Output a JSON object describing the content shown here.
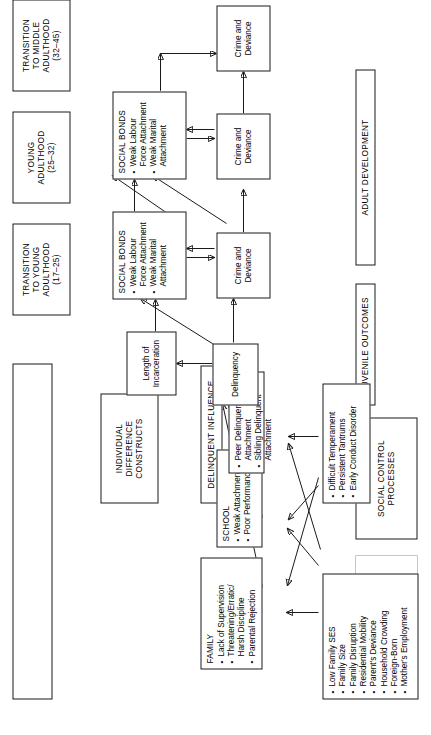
{
  "phase_headers": [
    {
      "id": "structural",
      "lines": [
        "STRUCTURAL",
        "BACKGROUND",
        "FACTORS"
      ]
    },
    {
      "id": "social-control",
      "lines": [
        "SOCIAL CONTROL",
        "PROCESSES"
      ]
    },
    {
      "id": "juvenile-outcomes",
      "lines": [
        "JUVENILE OUTCOMES"
      ]
    },
    {
      "id": "adult-development",
      "lines": [
        "ADULT DEVELOPMENT"
      ]
    },
    {
      "id": "individual-difference",
      "lines": [
        "INDIVIDUAL",
        "DIFFERENCE",
        "CONSTRUCTS"
      ]
    },
    {
      "id": "delinquent-influence",
      "lines": [
        "DELINQUENT INFLUENCE"
      ]
    }
  ],
  "constructs": {
    "structural_factors": {
      "title": "",
      "items": [
        "Low Family SES",
        "Family Size",
        "Family Disruption",
        "Residential Mobility",
        "Parent's Deviance",
        "Household Crowding",
        "Foreign-Born",
        "Mother's Employment"
      ]
    },
    "individual_difference": {
      "title": "",
      "items": [
        "Difficult Temperament",
        "Persistent Tantrums",
        "Early Conduct Disorder"
      ]
    },
    "family": {
      "title": "FAMILY",
      "items": [
        "Lack of Supervision",
        "Threatening/Erratic/ Harsh Discipline",
        "Parental Rejection"
      ]
    },
    "school": {
      "title": "SCHOOL",
      "items": [
        "Weak Attachment",
        "Poor Performance"
      ]
    },
    "delinquent_influence": {
      "title": "",
      "items": [
        "Peer Delinquent Attachment",
        "Sibling Delinquent Attachment"
      ]
    },
    "delinquency": {
      "label": "Delinquency"
    },
    "incarceration": {
      "label": "Length of Incarceration"
    },
    "social_bonds_young": {
      "title": "SOCIAL BONDS",
      "items": [
        "Weak Labour Force Attachment",
        "Weak Marital Attachment"
      ]
    },
    "social_bonds_middle": {
      "title": "SOCIAL BONDS",
      "items": [
        "Weak Labour Force Attachment",
        "Weak Marital Attachment"
      ]
    },
    "crime_1": {
      "label": "Crime and Deviance"
    },
    "crime_2": {
      "label": "Crime and Deviance"
    },
    "crime_3": {
      "label": "Crime and Deviance"
    }
  },
  "life_stages": {
    "early_strip": [
      {
        "name": "CHILDHOOD",
        "age": "(0–10)"
      },
      {
        "name": "ADOLESCENCE",
        "age": "(10–17)"
      }
    ],
    "later_boxes": [
      {
        "lines": [
          "TRANSITION",
          "TO YOUNG",
          "ADULTHOOD"
        ],
        "age": "(17–25)"
      },
      {
        "lines": [
          "YOUNG",
          "ADULTHOOD"
        ],
        "age": "(25–32)"
      },
      {
        "lines": [
          "TRANSITION",
          "TO MIDDLE",
          "ADULTHOOD"
        ],
        "age": "(32–45)"
      }
    ]
  },
  "style": {
    "line_color": "#1a1a1a",
    "background": "#ffffff"
  }
}
